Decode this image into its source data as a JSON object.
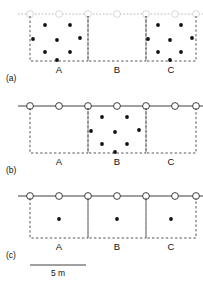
{
  "figure": {
    "panels": [
      {
        "tag": "(a)",
        "quadrat_labels": [
          "A",
          "B",
          "C"
        ],
        "description": "clustered-in-outer-quadrats"
      },
      {
        "tag": "(b)",
        "quadrat_labels": [
          "A",
          "B",
          "C"
        ],
        "description": "clustered-in-central-quadrat"
      },
      {
        "tag": "(c)",
        "quadrat_labels": [
          "A",
          "B",
          "C"
        ],
        "description": "uniform-one-per-quadrat"
      }
    ],
    "scale": {
      "label": "5 m",
      "bar_length_px": 56
    },
    "colors": {
      "point": "#111111",
      "line": "#2b2b2b",
      "quadrat_edge": "#2b2b2b",
      "faint_edge": "#9a9a9a",
      "node_fill": "#ffffff",
      "background": "#ffffff"
    }
  },
  "chart_data": {
    "type": "scatter",
    "xlabel": "",
    "ylabel": "",
    "xlim": [
      0,
      203
    ],
    "ylim": [
      0,
      285
    ],
    "grid": false,
    "legend": null,
    "scale_bar": {
      "label": "5 m",
      "length_px": 56
    },
    "panels": [
      {
        "tag": "(a)",
        "transect_visible": false,
        "node_count": 7,
        "nodes_x": [
          30,
          59,
          88,
          117,
          146,
          175,
          196
        ],
        "node_y": 14,
        "quadrats": [
          {
            "label": "A",
            "x0": 30,
            "x1": 88,
            "y0": 16,
            "y1": 61,
            "count": 8,
            "points": [
              {
                "x": 45,
                "y": 25
              },
              {
                "x": 70,
                "y": 25
              },
              {
                "x": 33,
                "y": 39
              },
              {
                "x": 57,
                "y": 40
              },
              {
                "x": 80,
                "y": 38
              },
              {
                "x": 45,
                "y": 52
              },
              {
                "x": 70,
                "y": 52
              },
              {
                "x": 57,
                "y": 60
              }
            ]
          },
          {
            "label": "B",
            "x0": 88,
            "x1": 146,
            "y0": 16,
            "y1": 61,
            "count": 0,
            "points": []
          },
          {
            "label": "C",
            "x0": 146,
            "x1": 196,
            "y0": 16,
            "y1": 61,
            "count": 8,
            "points": [
              {
                "x": 158,
                "y": 25
              },
              {
                "x": 181,
                "y": 25
              },
              {
                "x": 148,
                "y": 39
              },
              {
                "x": 170,
                "y": 40
              },
              {
                "x": 192,
                "y": 38
              },
              {
                "x": 158,
                "y": 52
              },
              {
                "x": 181,
                "y": 52
              },
              {
                "x": 170,
                "y": 60
              }
            ]
          }
        ]
      },
      {
        "tag": "(b)",
        "transect_visible": true,
        "node_count": 7,
        "nodes_x": [
          30,
          59,
          88,
          117,
          146,
          175,
          196
        ],
        "node_y": 106,
        "quadrats": [
          {
            "label": "A",
            "x0": 30,
            "x1": 88,
            "y0": 108,
            "y1": 153,
            "count": 0,
            "points": []
          },
          {
            "label": "B",
            "x0": 88,
            "x1": 146,
            "y0": 108,
            "y1": 153,
            "count": 8,
            "points": [
              {
                "x": 102,
                "y": 117
              },
              {
                "x": 127,
                "y": 117
              },
              {
                "x": 91,
                "y": 131
              },
              {
                "x": 115,
                "y": 132
              },
              {
                "x": 139,
                "y": 130
              },
              {
                "x": 102,
                "y": 144
              },
              {
                "x": 127,
                "y": 144
              },
              {
                "x": 115,
                "y": 152
              }
            ]
          },
          {
            "label": "C",
            "x0": 146,
            "x1": 196,
            "y0": 108,
            "y1": 153,
            "count": 0,
            "points": []
          }
        ]
      },
      {
        "tag": "(c)",
        "transect_visible": true,
        "node_count": 7,
        "nodes_x": [
          30,
          59,
          88,
          117,
          146,
          175,
          196
        ],
        "node_y": 196,
        "quadrats": [
          {
            "label": "A",
            "x0": 30,
            "x1": 88,
            "y0": 198,
            "y1": 238,
            "count": 1,
            "points": [
              {
                "x": 59,
                "y": 219
              }
            ]
          },
          {
            "label": "B",
            "x0": 88,
            "x1": 146,
            "y0": 198,
            "y1": 238,
            "count": 1,
            "points": [
              {
                "x": 117,
                "y": 219
              }
            ]
          },
          {
            "label": "C",
            "x0": 146,
            "x1": 196,
            "y0": 198,
            "y1": 238,
            "count": 1,
            "points": [
              {
                "x": 171,
                "y": 219
              }
            ]
          }
        ]
      }
    ]
  }
}
